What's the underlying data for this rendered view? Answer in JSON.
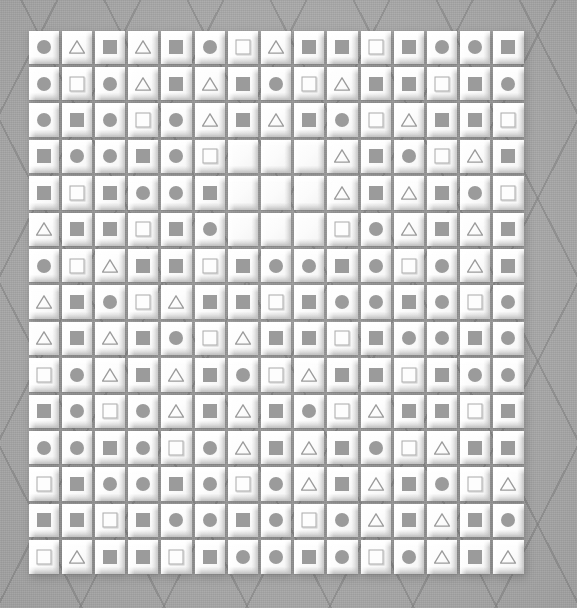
{
  "scene": {
    "title": "Beveled tile grid puzzle board",
    "background_color": "#a9a9a9",
    "tile_color": "#fdfdfd",
    "shape_color": "#9b9b9b",
    "grid_rows": 15,
    "grid_cols": 15,
    "shape_legend": {
      "circle": "filled-circle",
      "square": "filled-square",
      "osquare": "outline-square",
      "triangle": "outline-triangle",
      "empty": "blank-tile"
    }
  },
  "grid": [
    [
      "circle",
      "triangle",
      "square",
      "triangle",
      "square",
      "circle",
      "osquare",
      "triangle",
      "square",
      "square",
      "osquare",
      "square",
      "circle",
      "circle",
      "square"
    ],
    [
      "circle",
      "osquare",
      "circle",
      "triangle",
      "square",
      "triangle",
      "square",
      "circle",
      "osquare",
      "triangle",
      "square",
      "square",
      "osquare",
      "square",
      "circle"
    ],
    [
      "circle",
      "square",
      "circle",
      "osquare",
      "circle",
      "triangle",
      "square",
      "triangle",
      "square",
      "circle",
      "osquare",
      "triangle",
      "square",
      "square",
      "osquare"
    ],
    [
      "square",
      "circle",
      "circle",
      "square",
      "circle",
      "osquare",
      "empty",
      "empty",
      "empty",
      "triangle",
      "square",
      "circle",
      "osquare",
      "triangle",
      "square"
    ],
    [
      "square",
      "osquare",
      "square",
      "circle",
      "circle",
      "square",
      "empty",
      "empty",
      "empty",
      "triangle",
      "square",
      "triangle",
      "square",
      "circle",
      "osquare"
    ],
    [
      "triangle",
      "square",
      "square",
      "osquare",
      "square",
      "circle",
      "empty",
      "empty",
      "empty",
      "osquare",
      "circle",
      "triangle",
      "square",
      "triangle",
      "square"
    ],
    [
      "circle",
      "osquare",
      "triangle",
      "square",
      "square",
      "osquare",
      "square",
      "circle",
      "circle",
      "square",
      "circle",
      "osquare",
      "circle",
      "triangle",
      "square"
    ],
    [
      "triangle",
      "square",
      "circle",
      "osquare",
      "triangle",
      "square",
      "square",
      "osquare",
      "square",
      "circle",
      "circle",
      "square",
      "circle",
      "osquare",
      "circle"
    ],
    [
      "triangle",
      "square",
      "triangle",
      "square",
      "circle",
      "osquare",
      "triangle",
      "square",
      "square",
      "osquare",
      "square",
      "circle",
      "circle",
      "square",
      "circle"
    ],
    [
      "osquare",
      "circle",
      "triangle",
      "square",
      "triangle",
      "square",
      "circle",
      "osquare",
      "triangle",
      "square",
      "square",
      "osquare",
      "square",
      "circle",
      "circle"
    ],
    [
      "square",
      "circle",
      "osquare",
      "circle",
      "triangle",
      "square",
      "triangle",
      "square",
      "circle",
      "osquare",
      "triangle",
      "square",
      "square",
      "osquare",
      "square"
    ],
    [
      "circle",
      "circle",
      "square",
      "circle",
      "osquare",
      "circle",
      "triangle",
      "square",
      "triangle",
      "square",
      "circle",
      "osquare",
      "triangle",
      "square",
      "square"
    ],
    [
      "osquare",
      "square",
      "circle",
      "circle",
      "square",
      "circle",
      "osquare",
      "circle",
      "triangle",
      "square",
      "triangle",
      "square",
      "circle",
      "osquare",
      "triangle"
    ],
    [
      "square",
      "square",
      "osquare",
      "square",
      "circle",
      "circle",
      "square",
      "circle",
      "osquare",
      "circle",
      "triangle",
      "square",
      "triangle",
      "square",
      "circle"
    ],
    [
      "osquare",
      "triangle",
      "square",
      "square",
      "osquare",
      "square",
      "circle",
      "circle",
      "square",
      "circle",
      "osquare",
      "circle",
      "triangle",
      "square",
      "triangle"
    ]
  ]
}
